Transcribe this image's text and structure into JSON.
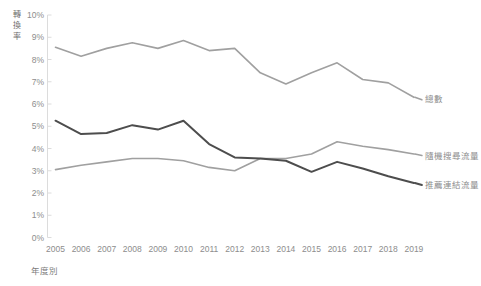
{
  "chart_data": {
    "type": "line",
    "title": "",
    "xlabel": "年度別",
    "ylabel": "轉換率",
    "grid": false,
    "legend_position": "right-inline",
    "x": [
      2005,
      2006,
      2007,
      2008,
      2009,
      2010,
      2011,
      2012,
      2013,
      2014,
      2015,
      2016,
      2017,
      2018,
      2019
    ],
    "categories": [
      "2005",
      "2006",
      "2007",
      "2008",
      "2009",
      "2010",
      "2011",
      "2012",
      "2013",
      "2014",
      "2015",
      "2016",
      "2017",
      "2018",
      "2019"
    ],
    "ylim": [
      0,
      10
    ],
    "ytick_values": [
      0,
      1,
      2,
      3,
      4,
      5,
      6,
      7,
      8,
      9,
      10
    ],
    "ytick_labels": [
      "0%",
      "1%",
      "2%",
      "3%",
      "4%",
      "5%",
      "6%",
      "7%",
      "8%",
      "9%",
      "10%"
    ],
    "series": [
      {
        "name": "總數",
        "color": "#a0a0a0",
        "values": [
          8.55,
          8.15,
          8.5,
          8.75,
          8.5,
          8.85,
          8.4,
          8.5,
          7.4,
          6.9,
          7.4,
          7.85,
          7.1,
          6.95,
          6.3
        ]
      },
      {
        "name": "隨機搜尋流量",
        "color": "#a0a0a0",
        "values": [
          3.05,
          3.25,
          3.4,
          3.55,
          3.55,
          3.45,
          3.15,
          3.0,
          3.55,
          3.55,
          3.75,
          4.3,
          4.1,
          3.95,
          3.75
        ]
      },
      {
        "name": "推薦連結流量",
        "color": "#4d4d4d",
        "values": [
          5.25,
          4.65,
          4.7,
          5.05,
          4.85,
          5.25,
          4.2,
          3.6,
          3.55,
          3.45,
          2.95,
          3.4,
          3.1,
          2.75,
          2.45
        ]
      }
    ]
  },
  "legend": {
    "items": [
      {
        "label": "總數",
        "color": "#a0a0a0"
      },
      {
        "label": "隨機搜尋流量",
        "color": "#a0a0a0"
      },
      {
        "label": "推薦連結流量",
        "color": "#4d4d4d"
      }
    ]
  },
  "axes": {
    "y_title": "轉換率",
    "y_title_chars": [
      "轉",
      "換",
      "率"
    ],
    "x_title": "年度別"
  },
  "colors": {
    "axis": "#dcdcdc",
    "tick_text": "#8d8d8d",
    "series_light": "#a0a0a0",
    "series_dark": "#4d4d4d",
    "background": "#ffffff"
  }
}
